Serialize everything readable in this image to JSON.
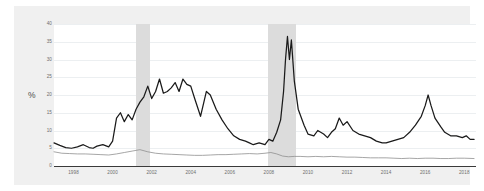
{
  "chart_data": {
    "type": "line",
    "title": "",
    "subtitle": "",
    "xlabel": "",
    "ylabel": "%",
    "ylim": [
      0,
      40
    ],
    "xlim": [
      1997,
      2018.6
    ],
    "grid": true,
    "legend": "none",
    "y_ticks": [
      0,
      5,
      10,
      15,
      20,
      25,
      30,
      35,
      40
    ],
    "x_ticks": [
      1998,
      2000,
      2002,
      2004,
      2006,
      2008,
      2010,
      2012,
      2014,
      2016,
      2018
    ],
    "colors": {
      "series_primary": "#1a1a1a",
      "series_secondary": "#8f8f8f",
      "recession_band": "#dcdcdc",
      "gridline": "#eceff1",
      "plot_background": "#ffffff",
      "card_background": "#f0f0f0",
      "tick_text": "#6d6d6d"
    },
    "shaded_regions": [
      {
        "name": "recession-2001",
        "start": 2001.2,
        "end": 2001.9
      },
      {
        "name": "recession-2008",
        "start": 2007.95,
        "end": 2009.4
      }
    ],
    "series": [
      {
        "name": "series-primary",
        "color": "#1a1a1a",
        "x": [
          1997.0,
          1997.3,
          1997.6,
          1997.9,
          1998.2,
          1998.5,
          1998.8,
          1999.0,
          1999.2,
          1999.5,
          1999.8,
          2000.0,
          2000.2,
          2000.4,
          2000.6,
          2000.8,
          2001.0,
          2001.2,
          2001.4,
          2001.6,
          2001.8,
          2002.0,
          2002.2,
          2002.4,
          2002.6,
          2002.8,
          2003.0,
          2003.2,
          2003.4,
          2003.6,
          2003.8,
          2004.0,
          2004.2,
          2004.5,
          2004.8,
          2005.0,
          2005.3,
          2005.6,
          2005.9,
          2006.2,
          2006.5,
          2006.8,
          2007.0,
          2007.2,
          2007.5,
          2007.8,
          2008.0,
          2008.2,
          2008.4,
          2008.6,
          2008.75,
          2008.85,
          2008.95,
          2009.05,
          2009.15,
          2009.3,
          2009.5,
          2009.8,
          2010.0,
          2010.3,
          2010.5,
          2010.8,
          2011.0,
          2011.2,
          2011.4,
          2011.6,
          2011.8,
          2012.0,
          2012.3,
          2012.6,
          2012.9,
          2013.2,
          2013.5,
          2013.8,
          2014.0,
          2014.3,
          2014.6,
          2014.9,
          2015.2,
          2015.5,
          2015.8,
          2016.0,
          2016.15,
          2016.3,
          2016.5,
          2016.8,
          2017.0,
          2017.3,
          2017.6,
          2017.9,
          2018.1,
          2018.3,
          2018.5
        ],
        "y": [
          6.5,
          5.8,
          5.2,
          5.0,
          5.4,
          6.0,
          5.2,
          5.0,
          5.6,
          6.0,
          5.4,
          7.0,
          13.5,
          15.0,
          12.5,
          14.5,
          13.0,
          16.0,
          18.0,
          19.5,
          22.5,
          19.0,
          21.0,
          24.5,
          20.5,
          21.0,
          22.0,
          23.5,
          21.0,
          24.5,
          23.0,
          22.5,
          19.0,
          14.0,
          21.0,
          20.0,
          16.0,
          13.0,
          10.5,
          8.5,
          7.5,
          7.0,
          6.5,
          6.0,
          6.5,
          6.0,
          7.5,
          7.0,
          9.5,
          13.0,
          21.0,
          30.0,
          36.5,
          30.0,
          35.5,
          24.0,
          16.0,
          11.5,
          9.0,
          8.5,
          10.0,
          9.0,
          8.0,
          9.5,
          10.5,
          13.5,
          11.5,
          12.5,
          10.0,
          9.0,
          8.5,
          8.0,
          7.0,
          6.5,
          6.5,
          7.0,
          7.5,
          8.0,
          9.5,
          11.5,
          14.0,
          17.0,
          20.0,
          17.0,
          13.5,
          11.0,
          9.5,
          8.5,
          8.5,
          8.0,
          8.5,
          7.5,
          7.5
        ]
      },
      {
        "name": "series-secondary",
        "color": "#8f8f8f",
        "x": [
          1997.0,
          1997.4,
          1997.8,
          1998.2,
          1998.6,
          1999.0,
          1999.4,
          1999.8,
          2000.2,
          2000.6,
          2001.0,
          2001.4,
          2001.8,
          2002.2,
          2002.6,
          2003.0,
          2003.4,
          2003.8,
          2004.2,
          2004.6,
          2005.0,
          2005.4,
          2005.8,
          2006.2,
          2006.6,
          2007.0,
          2007.4,
          2007.8,
          2008.1,
          2008.4,
          2008.7,
          2009.0,
          2009.3,
          2009.6,
          2010.0,
          2010.4,
          2010.8,
          2011.2,
          2011.6,
          2012.0,
          2012.4,
          2012.8,
          2013.2,
          2013.6,
          2014.0,
          2014.4,
          2014.8,
          2015.2,
          2015.6,
          2016.0,
          2016.4,
          2016.8,
          2017.2,
          2017.6,
          2018.0,
          2018.5
        ],
        "y": [
          4.0,
          3.6,
          3.5,
          3.4,
          3.4,
          3.3,
          3.2,
          3.1,
          3.4,
          3.8,
          4.2,
          4.6,
          4.0,
          3.6,
          3.4,
          3.3,
          3.2,
          3.1,
          3.0,
          3.0,
          3.1,
          3.2,
          3.2,
          3.3,
          3.4,
          3.5,
          3.4,
          3.6,
          3.8,
          3.4,
          2.8,
          2.6,
          2.7,
          2.7,
          2.6,
          2.7,
          2.6,
          2.7,
          2.6,
          2.5,
          2.5,
          2.4,
          2.3,
          2.3,
          2.3,
          2.2,
          2.1,
          2.2,
          2.1,
          2.2,
          2.2,
          2.1,
          2.1,
          2.2,
          2.2,
          2.1
        ]
      }
    ]
  }
}
